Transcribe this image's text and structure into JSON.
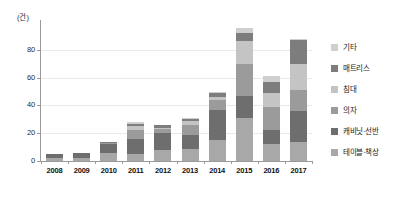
{
  "chart_data": {
    "type": "bar",
    "stacked": true,
    "title": "",
    "subtitle": "",
    "xlabel": "",
    "ylabel": "",
    "unit_label": "(건)",
    "grid": true,
    "legend_position": "right",
    "ylim": [
      0,
      100
    ],
    "yticks": [
      0,
      20,
      40,
      60,
      80
    ],
    "ytick_labels": [
      "0",
      "20",
      "40",
      "60",
      "80"
    ],
    "categories": [
      "2008",
      "2009",
      "2010",
      "2011",
      "2012",
      "2013",
      "2014",
      "2015",
      "2016",
      "2017"
    ],
    "series": [
      {
        "name": "테이블·책상",
        "color": "#a8a8a8",
        "values": [
          2,
          2,
          6,
          5,
          8,
          9,
          15,
          31,
          12,
          14
        ]
      },
      {
        "name": "캐비닛·선반",
        "color": "#6e6e6e",
        "values": [
          3,
          4,
          6,
          11,
          12,
          10,
          22,
          16,
          10,
          22
        ]
      },
      {
        "name": "의자",
        "color": "#9b9b9b",
        "values": [
          0,
          0,
          1,
          6,
          3,
          7,
          7,
          23,
          17,
          15
        ]
      },
      {
        "name": "침대",
        "color": "#c4c4c4",
        "values": [
          0,
          0,
          0,
          3,
          1,
          3,
          2,
          16,
          10,
          19
        ]
      },
      {
        "name": "매트리스",
        "color": "#7d7d7d",
        "values": [
          0,
          0,
          1,
          2,
          2,
          1,
          3,
          6,
          8,
          17
        ]
      },
      {
        "name": "기타",
        "color": "#cfcfcf",
        "values": [
          0,
          0,
          0,
          1,
          0,
          1,
          1,
          4,
          4,
          1
        ]
      }
    ],
    "totals": [
      5,
      6,
      14,
      28,
      26,
      31,
      50,
      96,
      61,
      88
    ]
  },
  "legend": {
    "items": [
      {
        "label": "기타",
        "color": "#cfcfcf"
      },
      {
        "label": "매트리스",
        "color": "#7d7d7d"
      },
      {
        "label": "침대",
        "color": "#c4c4c4"
      },
      {
        "label": "의자",
        "color": "#9b9b9b"
      },
      {
        "label": "캐비닛·선반",
        "color": "#6e6e6e"
      },
      {
        "label": "테이블·책상",
        "color": "#a8a8a8"
      }
    ]
  },
  "colors": {
    "axis": "#9a9a9a",
    "grid": "#e9e9e9",
    "text": "#1a1a1a",
    "background": "#ffffff"
  }
}
